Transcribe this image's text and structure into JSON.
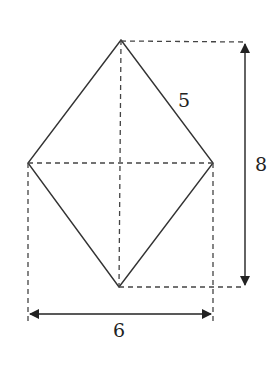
{
  "diagram": {
    "shape": "rhombus",
    "colors": {
      "stroke": "#333333",
      "dashed": "#444444",
      "background": "#ffffff"
    },
    "vertices": {
      "top": [
        121,
        40
      ],
      "left": [
        28,
        163
      ],
      "right": [
        213,
        163
      ],
      "bottom": [
        119,
        287
      ]
    },
    "labels": {
      "side": "5",
      "height_diagonal": "8",
      "width_diagonal": "6"
    },
    "dimensions": {
      "side_length": 5,
      "vertical_diagonal": 8,
      "horizontal_diagonal": 6
    }
  }
}
